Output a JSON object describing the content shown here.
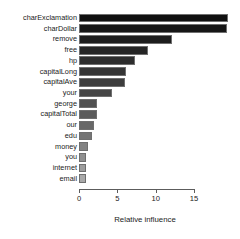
{
  "chart_data": {
    "type": "bar",
    "orientation": "horizontal",
    "title": "",
    "xlabel": "Relative influence",
    "ylabel": "",
    "xlim": [
      0,
      15.5
    ],
    "xticks": [
      0,
      5,
      10,
      15
    ],
    "xtick_labels": [
      "0",
      "5",
      "10",
      "15"
    ],
    "grid": false,
    "legend": false,
    "categories": [
      "charExclamation",
      "charDollar",
      "remove",
      "free",
      "hp",
      "capitalLong",
      "capitalAve",
      "your",
      "george",
      "capitalTotal",
      "our",
      "edu",
      "money",
      "you",
      "internet",
      "email"
    ],
    "values": [
      19.4,
      19.3,
      12.1,
      9.0,
      7.3,
      6.1,
      6.0,
      4.3,
      2.4,
      2.4,
      2.0,
      1.7,
      1.2,
      0.9,
      0.9,
      0.9
    ],
    "bar_colors": [
      "#101010",
      "#161616",
      "#1d1d1d",
      "#252525",
      "#2d2d2d",
      "#353535",
      "#3d3d3d",
      "#464646",
      "#515151",
      "#5b5b5b",
      "#686868",
      "#757575",
      "#828282",
      "#909090",
      "#9d9d9d",
      "#a9a9a9"
    ],
    "bar_border_color": "#6f6f6f",
    "axis_color": "#5c5c5c",
    "background": "#ffffff"
  }
}
